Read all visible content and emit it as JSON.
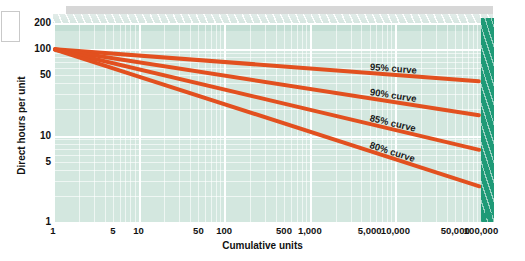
{
  "chart_data": {
    "type": "line",
    "title": "",
    "xlabel": "Cumulative units",
    "ylabel": "Direct hours per unit",
    "xscale": "log",
    "yscale": "log",
    "xlim": [
      1,
      100000
    ],
    "ylim": [
      1,
      200
    ],
    "grid": true,
    "legend_position": "inline-right",
    "xticks": [
      "1",
      "5",
      "10",
      "50",
      "100",
      "500",
      "1,000",
      "5,000",
      "10,000",
      "50,000",
      "100,000"
    ],
    "xtick_values": [
      1,
      5,
      10,
      50,
      100,
      500,
      1000,
      5000,
      10000,
      50000,
      100000
    ],
    "yticks": [
      "1",
      "5",
      "10",
      "50",
      "100",
      "200"
    ],
    "ytick_values": [
      1,
      5,
      10,
      50,
      100,
      200
    ],
    "series": [
      {
        "name": "95% curve",
        "label": "95% curve",
        "learning_rate": 0.95,
        "color": "#e2501f",
        "x": [
          1,
          10,
          100,
          1000,
          10000,
          100000
        ],
        "values": [
          100,
          84.1,
          70.8,
          59.5,
          50.1,
          42.2
        ]
      },
      {
        "name": "90% curve",
        "label": "90% curve",
        "learning_rate": 0.9,
        "color": "#e2501f",
        "x": [
          1,
          10,
          100,
          1000,
          10000,
          100000
        ],
        "values": [
          100,
          70.1,
          49.2,
          34.5,
          24.2,
          17.0
        ]
      },
      {
        "name": "85% curve",
        "label": "85% curve",
        "learning_rate": 0.85,
        "color": "#e2501f",
        "x": [
          1,
          10,
          100,
          1000,
          10000,
          100000
        ],
        "values": [
          100,
          58.3,
          34.0,
          19.8,
          11.6,
          6.75
        ]
      },
      {
        "name": "80% curve",
        "label": "80% curve",
        "learning_rate": 0.8,
        "color": "#e2501f",
        "x": [
          1,
          10,
          100,
          1000,
          10000,
          100000
        ],
        "values": [
          100,
          48.0,
          23.0,
          11.1,
          5.31,
          2.55
        ]
      }
    ],
    "annotations": [
      {
        "text": "95% curve",
        "series": "95% curve"
      },
      {
        "text": "90% curve",
        "series": "90% curve"
      },
      {
        "text": "85% curve",
        "series": "85% curve"
      },
      {
        "text": "80% curve",
        "series": "80% curve"
      }
    ],
    "colors": {
      "curve": "#e2501f",
      "panel": "#d3e7df",
      "grid": "#ffffff",
      "side_face": "#1f9a77",
      "shadow": "#d7d7d7"
    }
  },
  "axes": {
    "y_title": "Direct hours per unit",
    "x_title": "Cumulative units",
    "y_labels": [
      "200",
      "100",
      "50",
      "10",
      "5",
      "1"
    ],
    "x_labels": [
      "1",
      "5",
      "10",
      "50",
      "100",
      "500",
      "1,000",
      "5,000",
      "10,000",
      "50,000",
      "100,000"
    ]
  },
  "curve_labels": {
    "c95": "95% curve",
    "c90": "90% curve",
    "c85": "85% curve",
    "c80": "80% curve"
  }
}
